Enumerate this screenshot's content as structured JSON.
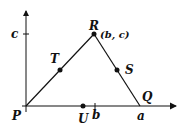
{
  "diagram": {
    "type": "coordinate-geometry-triangle",
    "axes": {
      "x_tick_labels": [
        "b",
        "a"
      ],
      "y_tick_labels": [
        "c"
      ]
    },
    "points": {
      "P": {
        "label": "P"
      },
      "Q": {
        "label": "Q"
      },
      "R": {
        "label": "R",
        "coords": "(b, c)"
      },
      "S": {
        "label": "S"
      },
      "T": {
        "label": "T"
      },
      "U": {
        "label": "U"
      }
    },
    "stroke_color": "#111111",
    "background": "#ffffff"
  }
}
